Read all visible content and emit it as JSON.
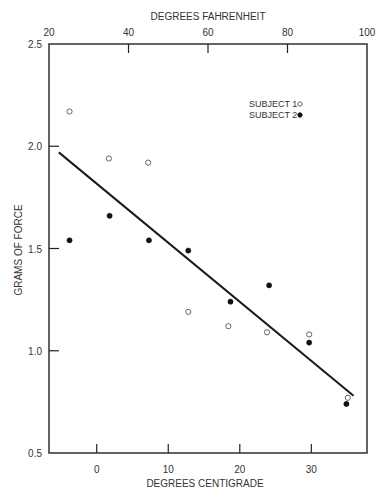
{
  "chart_data": {
    "type": "scatter",
    "title": "",
    "xlabel": "DEGREES CENTIGRADE",
    "x2label": "DEGREES FAHRENHEIT",
    "ylabel": "GRAMS OF FORCE",
    "xlim": [
      -6.67,
      37.78
    ],
    "ylim": [
      0.5,
      2.5
    ],
    "x_ticks": [
      0,
      10,
      20,
      30
    ],
    "x_tick_labels": [
      "0",
      "10",
      "20",
      "30"
    ],
    "x2_ticks": [
      20,
      40,
      60,
      80,
      100
    ],
    "x2_tick_labels": [
      "20",
      "40",
      "60",
      "80",
      "100"
    ],
    "y_ticks": [
      0.5,
      1.0,
      1.5,
      2.0,
      2.5
    ],
    "y_tick_labels": [
      "0.5",
      "1.0",
      "1.5",
      "2.0",
      "2.5"
    ],
    "grid": false,
    "legend_position": "upper right",
    "series": [
      {
        "name": "SUBJECT 1",
        "marker": "open-circle",
        "x": [
          -3.8,
          1.7,
          7.2,
          12.8,
          18.4,
          23.8,
          29.7,
          35.1
        ],
        "y": [
          2.17,
          1.94,
          1.92,
          1.19,
          1.12,
          1.09,
          1.08,
          0.77
        ]
      },
      {
        "name": "SUBJECT 2",
        "marker": "filled-circle",
        "x": [
          -3.8,
          1.8,
          7.3,
          12.8,
          18.7,
          24.1,
          29.7,
          34.9
        ],
        "y": [
          1.54,
          1.66,
          1.54,
          1.49,
          1.24,
          1.32,
          1.04,
          0.74
        ]
      }
    ],
    "fit_line": {
      "name": "regression",
      "x": [
        -5.3,
        35.9
      ],
      "y": [
        1.97,
        0.78
      ]
    }
  },
  "legend": {
    "items": [
      {
        "label": "SUBJECT 1",
        "marker": "open-circle"
      },
      {
        "label": "SUBJECT 2",
        "marker": "filled-circle"
      }
    ]
  }
}
